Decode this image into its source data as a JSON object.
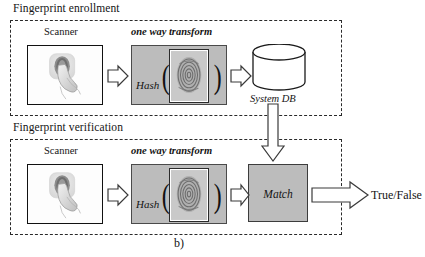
{
  "figure": {
    "caption": "b)",
    "sections": [
      {
        "title": "Fingerprint enrollment",
        "nodes": {
          "scanner_label": "Scanner",
          "transform_label": "one way transform",
          "hash_label": "Hash",
          "db_label": "System DB"
        }
      },
      {
        "title": "Fingerprint verification",
        "nodes": {
          "scanner_label": "Scanner",
          "transform_label": "one way transform",
          "hash_label": "Hash",
          "match_label": "Match",
          "output_label": "True/False"
        }
      }
    ],
    "icons": {
      "scanner": "fingerprint-on-sensor-icon",
      "fingerprint": "fingerprint-image-icon",
      "database": "database-cylinder-icon",
      "arrow_right": "block-arrow-right-icon",
      "arrow_down": "block-arrow-down-icon"
    },
    "colors": {
      "gray_fill": "#bcbcbc",
      "stroke": "#2a2a2a",
      "background": "#ffffff"
    }
  }
}
